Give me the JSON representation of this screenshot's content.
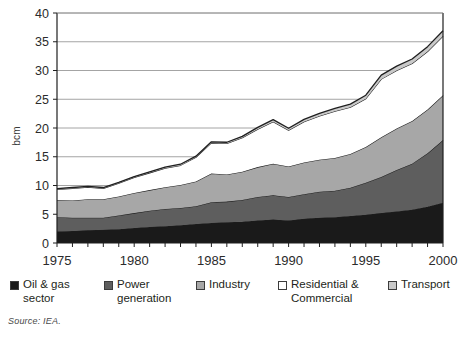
{
  "figure": {
    "source_note": "Source: IEA."
  },
  "chart_data": {
    "type": "area",
    "stacked": true,
    "title": "",
    "xlabel": "",
    "ylabel": "bcm",
    "xlim": [
      1975,
      2000
    ],
    "ylim": [
      0,
      40
    ],
    "ytick_step": 5,
    "grid": true,
    "grid_axis": "y",
    "x": [
      1975,
      1976,
      1977,
      1978,
      1979,
      1980,
      1981,
      1982,
      1983,
      1984,
      1985,
      1986,
      1987,
      1988,
      1989,
      1990,
      1991,
      1992,
      1993,
      1994,
      1995,
      1996,
      1997,
      1998,
      1999,
      2000
    ],
    "xticks": [
      1975,
      1980,
      1985,
      1990,
      1995,
      2000
    ],
    "xticklabels": [
      "1975",
      "1980",
      "1985",
      "1990",
      "1995",
      "2000"
    ],
    "yticks": [
      0,
      5,
      10,
      15,
      20,
      25,
      30,
      35,
      40
    ],
    "yticklabels": [
      "0",
      "5",
      "10",
      "15",
      "20",
      "25",
      "30",
      "35",
      "40"
    ],
    "legend_position": "below",
    "series": [
      {
        "name": "Oil & gas sector",
        "color": "#1a1a1a",
        "values": [
          2.0,
          2.1,
          2.2,
          2.3,
          2.4,
          2.6,
          2.8,
          2.9,
          3.1,
          3.3,
          3.5,
          3.6,
          3.7,
          3.9,
          4.1,
          3.9,
          4.2,
          4.4,
          4.5,
          4.7,
          4.9,
          5.2,
          5.5,
          5.8,
          6.3,
          7.0
        ]
      },
      {
        "name": "Power generation",
        "color": "#5e5e5e",
        "values": [
          2.5,
          2.3,
          2.2,
          2.1,
          2.4,
          2.6,
          2.8,
          3.0,
          3.0,
          3.1,
          3.6,
          3.6,
          3.8,
          4.1,
          4.2,
          4.1,
          4.3,
          4.5,
          4.6,
          4.9,
          5.6,
          6.3,
          7.2,
          8.0,
          9.3,
          10.9
        ]
      },
      {
        "name": "Industry",
        "color": "#a7a7a7",
        "values": [
          3.0,
          3.0,
          3.2,
          3.2,
          3.3,
          3.5,
          3.6,
          3.8,
          4.0,
          4.3,
          5.0,
          4.7,
          4.9,
          5.2,
          5.5,
          5.3,
          5.5,
          5.6,
          5.7,
          5.9,
          6.2,
          6.9,
          7.2,
          7.4,
          7.6,
          7.8
        ]
      },
      {
        "name": "Residential & Commercial",
        "color": "#ffffff",
        "values": [
          1.8,
          2.1,
          2.1,
          1.9,
          2.3,
          2.7,
          3.0,
          3.3,
          3.4,
          4.2,
          5.3,
          5.4,
          5.9,
          6.6,
          7.3,
          6.3,
          7.1,
          7.6,
          8.1,
          8.1,
          8.4,
          10.1,
          10.1,
          10.0,
          10.1,
          10.3
        ]
      },
      {
        "name": "Transport",
        "color": "#c9c9c9",
        "values": [
          0.15,
          0.15,
          0.15,
          0.15,
          0.15,
          0.15,
          0.18,
          0.18,
          0.2,
          0.2,
          0.2,
          0.22,
          0.25,
          0.3,
          0.35,
          0.35,
          0.4,
          0.45,
          0.5,
          0.55,
          0.6,
          0.7,
          0.75,
          0.8,
          0.85,
          0.9
        ]
      }
    ],
    "totals": [
      9.45,
      9.65,
      9.85,
      9.65,
      10.55,
      11.55,
      12.38,
      13.18,
      13.7,
      15.1,
      17.6,
      17.52,
      18.55,
      20.1,
      21.45,
      19.95,
      21.5,
      22.55,
      23.4,
      24.15,
      25.7,
      29.2,
      30.75,
      32.0,
      34.15,
      36.9
    ]
  },
  "legend": {
    "items": [
      {
        "label": "Oil & gas\nsector",
        "color": "#1a1a1a",
        "left": 10,
        "width": 95
      },
      {
        "label": "Power\ngeneration",
        "color": "#5e5e5e",
        "left": 104,
        "width": 90
      },
      {
        "label": "Industry",
        "color": "#a7a7a7",
        "left": 196,
        "width": 80
      },
      {
        "label": "Residential &\nCommercial",
        "color": "#ffffff",
        "left": 278,
        "width": 105
      },
      {
        "label": "Transport",
        "color": "#c9c9c9",
        "left": 388,
        "width": 78
      }
    ]
  }
}
